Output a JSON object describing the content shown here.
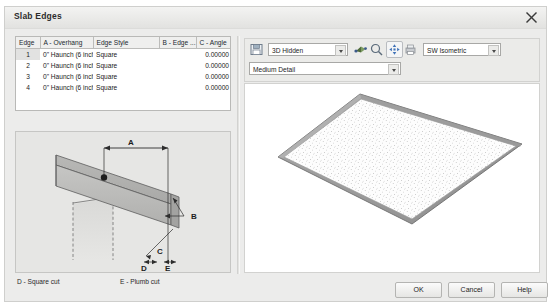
{
  "window": {
    "title": "Slab Edges",
    "close_icon": "close-icon"
  },
  "table": {
    "columns": [
      "Edge",
      "A - Overhang",
      "Edge Style",
      "B - Edge ...",
      "C - Angle"
    ],
    "rows": [
      {
        "edge": "1",
        "overhang": "0\" Haunch (6 inch slab)",
        "style": "Square",
        "b_edge": "",
        "angle": "0.00000",
        "selected": true
      },
      {
        "edge": "2",
        "overhang": "0\" Haunch (6 inch slab)",
        "style": "Square",
        "b_edge": "",
        "angle": "0.00000",
        "selected": false
      },
      {
        "edge": "3",
        "overhang": "0\" Haunch (6 inch slab)",
        "style": "Square",
        "b_edge": "",
        "angle": "0.00000",
        "selected": false
      },
      {
        "edge": "4",
        "overhang": "0\" Haunch (6 inch slab)",
        "style": "Square",
        "b_edge": "",
        "angle": "0.00000",
        "selected": false
      }
    ]
  },
  "diagram": {
    "labels": {
      "a": "A",
      "b": "B",
      "c": "C",
      "d": "D",
      "e": "E"
    },
    "caption_d": "D - Square cut",
    "caption_e": "E - Plumb cut"
  },
  "toolbar": {
    "save_icon": "save-icon",
    "visual_style": {
      "value": "3D Hidden"
    },
    "detail_level": {
      "value": "Medium Detail"
    },
    "view_direction": {
      "value": "SW Isometric"
    },
    "icons": [
      "shade-icon",
      "zoom-icon",
      "pan-icon",
      "print-icon"
    ]
  },
  "footer": {
    "ok": "OK",
    "cancel": "Cancel",
    "help": "Help"
  },
  "colors": {
    "dialog_bg": "#ececeb",
    "panel_bg": "#e6e6e4",
    "field_bg": "#ffffff",
    "border": "#b9b9b7",
    "text": "#1a1a1a"
  }
}
